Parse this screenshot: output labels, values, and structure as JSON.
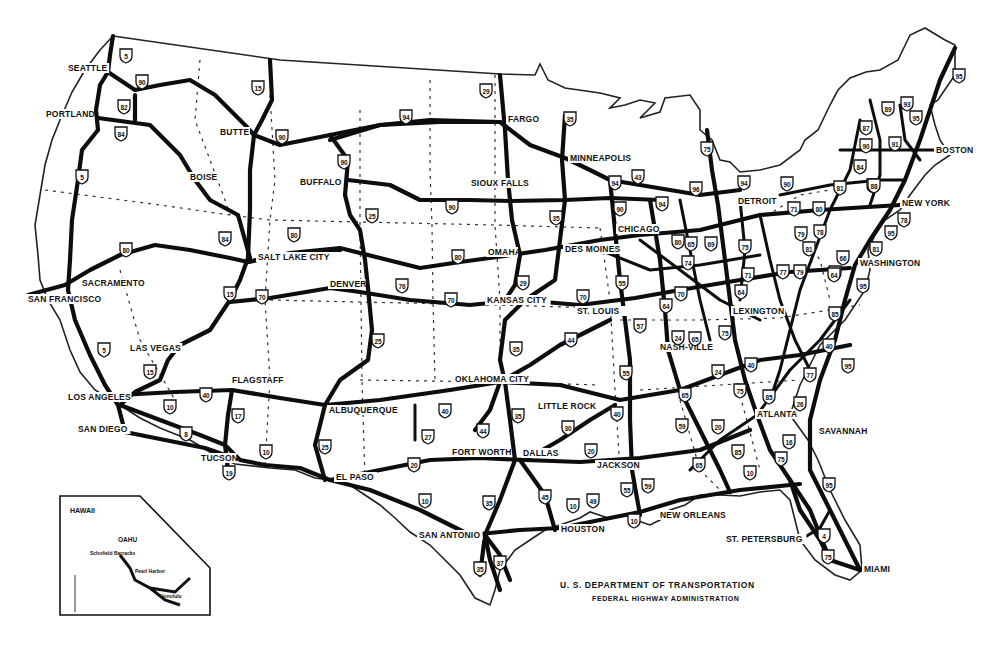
{
  "map": {
    "title": "Interstate Highway System",
    "credit": {
      "line1": "U. S. DEPARTMENT OF TRANSPORTATION",
      "line2": "FEDERAL HIGHWAY ADMINISTRATION"
    },
    "cities": [
      {
        "name": "SEATTLE",
        "x": 68,
        "y": 71
      },
      {
        "name": "PORTLAND",
        "x": 46,
        "y": 117
      },
      {
        "name": "BOISE",
        "x": 190,
        "y": 180
      },
      {
        "name": "BUTTE",
        "x": 220,
        "y": 135
      },
      {
        "name": "BUFFALO",
        "x": 300,
        "y": 185
      },
      {
        "name": "FARGO",
        "x": 508,
        "y": 122
      },
      {
        "name": "MINNEAPOLIS",
        "x": 570,
        "y": 161
      },
      {
        "name": "SIOUX FALLS",
        "x": 471,
        "y": 186
      },
      {
        "name": "DETROIT",
        "x": 738,
        "y": 204
      },
      {
        "name": "BOSTON",
        "x": 936,
        "y": 153
      },
      {
        "name": "NEW YORK",
        "x": 902,
        "y": 206
      },
      {
        "name": "CHICAGO",
        "x": 618,
        "y": 232
      },
      {
        "name": "DES MOINES",
        "x": 565,
        "y": 252
      },
      {
        "name": "OMAHA",
        "x": 488,
        "y": 255
      },
      {
        "name": "SALT LAKE CITY",
        "x": 258,
        "y": 260
      },
      {
        "name": "SACRAMENTO",
        "x": 82,
        "y": 286
      },
      {
        "name": "SAN FRANCISCO",
        "x": 28,
        "y": 302
      },
      {
        "name": "DENVER",
        "x": 330,
        "y": 287
      },
      {
        "name": "KANSAS CITY",
        "x": 487,
        "y": 303
      },
      {
        "name": "ST. LOUIS",
        "x": 577,
        "y": 314
      },
      {
        "name": "WASHINGTON",
        "x": 860,
        "y": 266
      },
      {
        "name": "LEXINGTON",
        "x": 733,
        "y": 314
      },
      {
        "name": "NASH-VILLE",
        "x": 660,
        "y": 350
      },
      {
        "name": "LAS VEGAS",
        "x": 130,
        "y": 351
      },
      {
        "name": "LOS ANGELES",
        "x": 68,
        "y": 400
      },
      {
        "name": "SAN DIEGO",
        "x": 78,
        "y": 432
      },
      {
        "name": "FLAGSTAFF",
        "x": 232,
        "y": 383
      },
      {
        "name": "ALBUQUERQUE",
        "x": 329,
        "y": 413
      },
      {
        "name": "OKLAHOMA CITY",
        "x": 455,
        "y": 382
      },
      {
        "name": "LITTLE ROCK",
        "x": 538,
        "y": 409
      },
      {
        "name": "ATLANTA",
        "x": 757,
        "y": 417
      },
      {
        "name": "SAVANNAH",
        "x": 819,
        "y": 434
      },
      {
        "name": "TUCSON",
        "x": 201,
        "y": 461
      },
      {
        "name": "EL PASO",
        "x": 336,
        "y": 480
      },
      {
        "name": "FORT WORTH",
        "x": 452,
        "y": 455
      },
      {
        "name": "DALLAS",
        "x": 523,
        "y": 456
      },
      {
        "name": "JACKSON",
        "x": 597,
        "y": 468
      },
      {
        "name": "NEW ORLEANS",
        "x": 660,
        "y": 518
      },
      {
        "name": "HOUSTON",
        "x": 561,
        "y": 532
      },
      {
        "name": "SAN ANTONIO",
        "x": 419,
        "y": 538
      },
      {
        "name": "ST. PETERSBURG",
        "x": 726,
        "y": 542
      },
      {
        "name": "MIAMI",
        "x": 864,
        "y": 572
      }
    ],
    "shields": [
      {
        "num": "5",
        "x": 126,
        "y": 55
      },
      {
        "num": "90",
        "x": 142,
        "y": 81
      },
      {
        "num": "82",
        "x": 124,
        "y": 106
      },
      {
        "num": "84",
        "x": 121,
        "y": 133
      },
      {
        "num": "15",
        "x": 258,
        "y": 87
      },
      {
        "num": "90",
        "x": 282,
        "y": 136
      },
      {
        "num": "5",
        "x": 82,
        "y": 176
      },
      {
        "num": "29",
        "x": 486,
        "y": 90
      },
      {
        "name": "94",
        "num": "94",
        "x": 406,
        "y": 116
      },
      {
        "num": "35",
        "x": 570,
        "y": 118
      },
      {
        "num": "90",
        "x": 344,
        "y": 161
      },
      {
        "num": "90",
        "x": 452,
        "y": 206
      },
      {
        "num": "25",
        "x": 372,
        "y": 215
      },
      {
        "num": "84",
        "x": 225,
        "y": 238
      },
      {
        "num": "80",
        "x": 294,
        "y": 234
      },
      {
        "num": "80",
        "x": 126,
        "y": 249
      },
      {
        "num": "80",
        "x": 458,
        "y": 256
      },
      {
        "num": "35",
        "x": 556,
        "y": 217
      },
      {
        "num": "29",
        "x": 523,
        "y": 282
      },
      {
        "num": "15",
        "x": 230,
        "y": 293
      },
      {
        "num": "70",
        "x": 262,
        "y": 296
      },
      {
        "num": "76",
        "x": 402,
        "y": 285
      },
      {
        "num": "70",
        "x": 451,
        "y": 299
      },
      {
        "num": "70",
        "x": 583,
        "y": 296
      },
      {
        "num": "55",
        "x": 622,
        "y": 282
      },
      {
        "num": "25",
        "x": 378,
        "y": 340
      },
      {
        "num": "35",
        "x": 516,
        "y": 348
      },
      {
        "num": "44",
        "x": 571,
        "y": 339
      },
      {
        "num": "57",
        "x": 640,
        "y": 325
      },
      {
        "num": "5",
        "x": 104,
        "y": 349
      },
      {
        "num": "15",
        "x": 150,
        "y": 371
      },
      {
        "num": "40",
        "x": 206,
        "y": 394
      },
      {
        "num": "10",
        "x": 170,
        "y": 406
      },
      {
        "num": "17",
        "x": 238,
        "y": 415
      },
      {
        "num": "8",
        "x": 186,
        "y": 433
      },
      {
        "num": "10",
        "x": 266,
        "y": 451
      },
      {
        "num": "19",
        "x": 229,
        "y": 472
      },
      {
        "num": "25",
        "x": 325,
        "y": 446
      },
      {
        "num": "27",
        "x": 428,
        "y": 436
      },
      {
        "num": "40",
        "x": 445,
        "y": 410
      },
      {
        "num": "44",
        "x": 483,
        "y": 430
      },
      {
        "num": "35",
        "x": 518,
        "y": 415
      },
      {
        "num": "30",
        "x": 568,
        "y": 427
      },
      {
        "num": "40",
        "x": 617,
        "y": 413
      },
      {
        "num": "20",
        "x": 591,
        "y": 450
      },
      {
        "num": "20",
        "x": 414,
        "y": 464
      },
      {
        "num": "55",
        "x": 626,
        "y": 372
      },
      {
        "num": "65",
        "x": 685,
        "y": 394
      },
      {
        "num": "59",
        "x": 648,
        "y": 485
      },
      {
        "num": "55",
        "x": 627,
        "y": 489
      },
      {
        "num": "10",
        "x": 425,
        "y": 500
      },
      {
        "num": "35",
        "x": 489,
        "y": 502
      },
      {
        "num": "45",
        "x": 545,
        "y": 496
      },
      {
        "num": "10",
        "x": 573,
        "y": 505
      },
      {
        "num": "49",
        "x": 593,
        "y": 500
      },
      {
        "num": "10",
        "x": 634,
        "y": 520
      },
      {
        "num": "37",
        "x": 500,
        "y": 562
      },
      {
        "num": "35",
        "x": 480,
        "y": 568
      },
      {
        "num": "10",
        "x": 750,
        "y": 472
      },
      {
        "num": "16",
        "x": 789,
        "y": 441
      },
      {
        "num": "75",
        "x": 781,
        "y": 458
      },
      {
        "num": "95",
        "x": 829,
        "y": 484
      },
      {
        "num": "4",
        "x": 824,
        "y": 535
      },
      {
        "num": "75",
        "x": 828,
        "y": 556
      },
      {
        "num": "85",
        "x": 738,
        "y": 451
      },
      {
        "num": "65",
        "x": 699,
        "y": 464
      },
      {
        "num": "20",
        "x": 718,
        "y": 426
      },
      {
        "num": "59",
        "x": 682,
        "y": 425
      },
      {
        "num": "85",
        "x": 769,
        "y": 396
      },
      {
        "num": "26",
        "x": 800,
        "y": 403
      },
      {
        "num": "77",
        "x": 810,
        "y": 374
      },
      {
        "num": "95",
        "x": 848,
        "y": 365
      },
      {
        "num": "40",
        "x": 829,
        "y": 345
      },
      {
        "num": "85",
        "x": 835,
        "y": 313
      },
      {
        "num": "95",
        "x": 863,
        "y": 285
      },
      {
        "num": "75",
        "x": 740,
        "y": 390
      },
      {
        "num": "40",
        "x": 751,
        "y": 364
      },
      {
        "num": "24",
        "x": 718,
        "y": 371
      },
      {
        "num": "65",
        "x": 695,
        "y": 338
      },
      {
        "num": "64",
        "x": 666,
        "y": 305
      },
      {
        "num": "70",
        "x": 681,
        "y": 293
      },
      {
        "num": "24",
        "x": 678,
        "y": 337
      },
      {
        "num": "75",
        "x": 725,
        "y": 332
      },
      {
        "num": "64",
        "x": 741,
        "y": 291
      },
      {
        "num": "71",
        "x": 748,
        "y": 274
      },
      {
        "num": "77",
        "x": 783,
        "y": 271
      },
      {
        "num": "79",
        "x": 800,
        "y": 271
      },
      {
        "num": "64",
        "x": 835,
        "y": 272
      },
      {
        "num": "81",
        "x": 809,
        "y": 248
      },
      {
        "num": "75",
        "x": 745,
        "y": 246
      },
      {
        "num": "69",
        "x": 711,
        "y": 243
      },
      {
        "num": "65",
        "x": 691,
        "y": 243
      },
      {
        "num": "80",
        "x": 678,
        "y": 241
      },
      {
        "num": "74",
        "x": 688,
        "y": 262
      },
      {
        "num": "94",
        "x": 662,
        "y": 203
      },
      {
        "num": "90",
        "x": 620,
        "y": 208
      },
      {
        "num": "94",
        "x": 615,
        "y": 182
      },
      {
        "num": "43",
        "x": 638,
        "y": 176
      },
      {
        "num": "94",
        "x": 744,
        "y": 182
      },
      {
        "num": "96",
        "x": 696,
        "y": 188
      },
      {
        "num": "75",
        "x": 707,
        "y": 148
      },
      {
        "num": "90",
        "x": 787,
        "y": 183
      },
      {
        "num": "81",
        "x": 840,
        "y": 187
      },
      {
        "num": "71",
        "x": 794,
        "y": 208
      },
      {
        "num": "80",
        "x": 819,
        "y": 208
      },
      {
        "num": "78",
        "x": 820,
        "y": 231
      },
      {
        "num": "79",
        "x": 801,
        "y": 233
      },
      {
        "num": "87",
        "x": 866,
        "y": 127
      },
      {
        "num": "90",
        "x": 866,
        "y": 145
      },
      {
        "num": "91",
        "x": 895,
        "y": 143
      },
      {
        "num": "84",
        "x": 860,
        "y": 166
      },
      {
        "num": "90",
        "x": 873,
        "y": 185
      },
      {
        "num": "88",
        "x": 874,
        "y": 185
      },
      {
        "num": "89",
        "x": 888,
        "y": 108
      },
      {
        "num": "93",
        "x": 907,
        "y": 103
      },
      {
        "num": "95",
        "x": 916,
        "y": 117
      },
      {
        "num": "95",
        "x": 959,
        "y": 75
      },
      {
        "num": "78",
        "x": 904,
        "y": 219
      },
      {
        "num": "95",
        "x": 891,
        "y": 232
      },
      {
        "num": "81",
        "x": 876,
        "y": 248
      },
      {
        "num": "66",
        "x": 843,
        "y": 257
      },
      {
        "num": "64",
        "x": 834,
        "y": 274
      }
    ],
    "hawaii_inset": {
      "title": "HAWAII",
      "island": "OAHU",
      "places": [
        "Schofield Barracks",
        "Pearl Harbor",
        "Honolulu"
      ]
    },
    "colors": {
      "land": "#ffffff",
      "road": "#0d0d0d",
      "border": "#333333"
    }
  }
}
